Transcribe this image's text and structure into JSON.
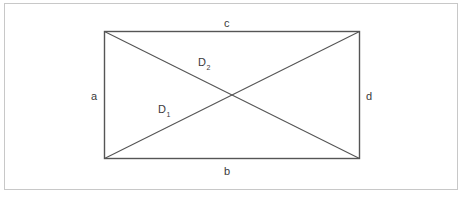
{
  "figure": {
    "type": "geometry-diagram",
    "shape": "rectangle-with-diagonals",
    "background_color": "#ffffff",
    "frame_color": "#c8c8c8",
    "stroke_color": "#555555",
    "text_color": "#3a3a3a",
    "rectangle": {
      "left": 104,
      "top": 31,
      "right": 360,
      "bottom": 159,
      "width": 256,
      "height": 128
    },
    "diagonals": [
      {
        "name": "D1",
        "from": "bottom-left",
        "to": "top-right"
      },
      {
        "name": "D2",
        "from": "top-left",
        "to": "bottom-right"
      }
    ],
    "intersection": {
      "x": 232,
      "y": 95
    }
  },
  "labels": {
    "side_top": "c",
    "side_bottom": "b",
    "side_left": "a",
    "side_right": "d",
    "diagonal_lower_base": "D",
    "diagonal_lower_sub": "1",
    "diagonal_upper_base": "D",
    "diagonal_upper_sub": "2"
  }
}
